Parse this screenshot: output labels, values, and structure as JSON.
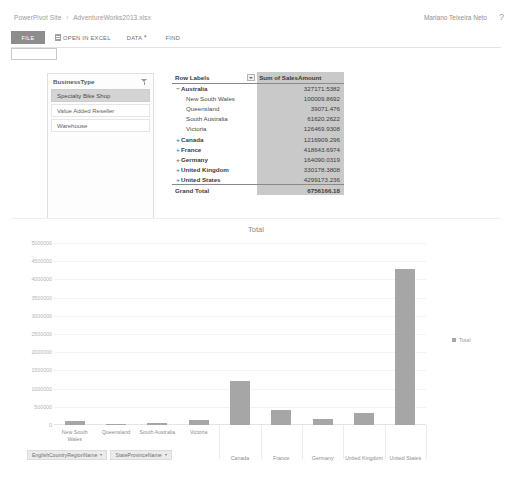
{
  "header": {
    "breadcrumb": {
      "site": "PowerPivot Site",
      "separator": "›",
      "file": "AdventureWorks2013.xlsx"
    },
    "user_name": "Mariano Teixeira Neto",
    "help_icon": "question-mark-icon"
  },
  "ribbon": {
    "file_tab": "FILE",
    "open_in_excel": "OPEN IN EXCEL",
    "excel_icon": "excel-icon",
    "data_menu": "DATA",
    "data_caret": "▾",
    "find": "FIND"
  },
  "name_box": {
    "value": ""
  },
  "slicer": {
    "title": "BusinessType",
    "filter_icon": "filter-clear-icon",
    "items": [
      {
        "label": "Specialty Bike Shop",
        "selected": true
      },
      {
        "label": "Value Added Reseller",
        "selected": false
      },
      {
        "label": "Warehouse",
        "selected": false
      }
    ]
  },
  "pivot": {
    "columns": [
      "Row Labels",
      "Sum of SalesAmount"
    ],
    "dropdown_icon": "chevron-down-icon",
    "rows": [
      {
        "label": "Australia",
        "value": "327171.5382",
        "level": 0,
        "expander": "−"
      },
      {
        "label": "New South Wales",
        "value": "100009.8692",
        "level": 1,
        "expander": ""
      },
      {
        "label": "Queensland",
        "value": "39071.476",
        "level": 1,
        "expander": ""
      },
      {
        "label": "South Australia",
        "value": "61620.2622",
        "level": 1,
        "expander": ""
      },
      {
        "label": "Victoria",
        "value": "126469.9308",
        "level": 1,
        "expander": ""
      },
      {
        "label": "Canada",
        "value": "1216909.296",
        "level": 0,
        "expander": "+"
      },
      {
        "label": "France",
        "value": "418643.6974",
        "level": 0,
        "expander": "+"
      },
      {
        "label": "Germany",
        "value": "164090.0319",
        "level": 0,
        "expander": "+"
      },
      {
        "label": "United Kingdom",
        "value": "330178.3808",
        "level": 0,
        "expander": "+"
      },
      {
        "label": "United States",
        "value": "4299173.236",
        "level": 0,
        "expander": "+"
      }
    ],
    "grand_total": {
      "label": "Grand Total",
      "value": "6756166.18"
    }
  },
  "chart_data": {
    "type": "bar",
    "title": "Total",
    "xlabel": "",
    "ylabel": "",
    "ylim": [
      0,
      5000000
    ],
    "ytick_step": 500000,
    "yticks": [
      "0",
      "500000",
      "1000000",
      "1500000",
      "2000000",
      "2500000",
      "3000000",
      "3500000",
      "4000000",
      "4500000",
      "5000000"
    ],
    "grid": true,
    "legend": [
      "Total"
    ],
    "legend_position": "right",
    "series": [
      {
        "name": "Total",
        "values": [
          100009.8692,
          39071.476,
          61620.2622,
          126469.9308,
          1216909.296,
          418643.6974,
          164090.0319,
          330178.3808,
          4299173.236
        ]
      }
    ],
    "categories": [
      "New South Wales",
      "Queensland",
      "South Australia",
      "Victoria",
      "Canada",
      "France",
      "Germany",
      "United Kingdom",
      "United States"
    ],
    "group_labels": [
      {
        "label": "Australia",
        "span_start": 0,
        "span_end": 3
      }
    ]
  },
  "field_buttons": [
    {
      "label": "EnglishCountryRegionName",
      "caret": "▾"
    },
    {
      "label": "StateProvinceName",
      "caret": "▾"
    }
  ]
}
